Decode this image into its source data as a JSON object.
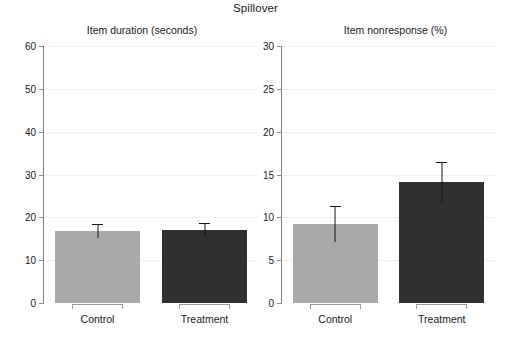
{
  "chart_data": {
    "type": "bar",
    "title": "Spillover",
    "panels": [
      {
        "id": "item-duration",
        "title": "Item duration (seconds)",
        "ylabel": "",
        "xlabel": "",
        "ylim": [
          0,
          60
        ],
        "yticks": [
          0,
          10,
          20,
          30,
          40,
          50,
          60
        ],
        "ytick_labels": [
          "0",
          "10",
          "20",
          "30",
          "40",
          "50",
          "60"
        ],
        "grid": true,
        "categories": [
          "Control",
          "Treatment"
        ],
        "values": [
          16.8,
          17.0
        ],
        "errors_low": [
          15.2,
          15.4
        ],
        "errors_high": [
          18.5,
          18.6
        ],
        "colors": [
          "#a9a9a9",
          "#303030"
        ]
      },
      {
        "id": "item-nonresponse",
        "title": "Item nonresponse (%)",
        "ylabel": "",
        "xlabel": "",
        "ylim": [
          0,
          30
        ],
        "yticks": [
          0,
          5,
          10,
          15,
          20,
          25,
          30
        ],
        "ytick_labels": [
          "0",
          "5",
          "10",
          "15",
          "20",
          "25",
          "30"
        ],
        "grid": true,
        "categories": [
          "Control",
          "Treatment"
        ],
        "values": [
          9.2,
          14.1
        ],
        "errors_low": [
          7.1,
          11.8
        ],
        "errors_high": [
          11.3,
          16.5
        ],
        "colors": [
          "#a9a9a9",
          "#303030"
        ]
      }
    ],
    "legend": null,
    "legend_position": "none"
  },
  "colors": {
    "control_bar": "#a9a9a9",
    "treatment_bar": "#303030",
    "axis": "#7d7d7d",
    "grid": "#f0f0f0",
    "text": "#1a1a1a",
    "background": "#ffffff"
  }
}
